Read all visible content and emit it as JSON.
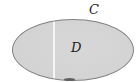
{
  "figure": {
    "labels": {
      "curve": "C",
      "region": "D"
    },
    "colors": {
      "background": "#ffffff",
      "region_fill": "#d5d5d5",
      "outline": "#818181",
      "label_text": "#1c1c1c",
      "fold_line": "#fafafa",
      "edge_mark": "#606060"
    }
  }
}
